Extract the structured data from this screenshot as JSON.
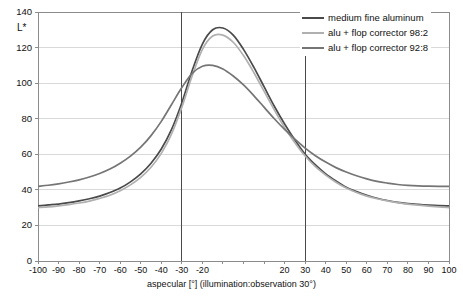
{
  "chart_data": {
    "type": "line",
    "title": "",
    "xlabel": "aspecular [°] (illumination:observation 30°)",
    "ylabel": "L*",
    "xlim": [
      -100,
      100
    ],
    "ylim": [
      0,
      140
    ],
    "y_ticks": [
      0,
      20,
      40,
      60,
      80,
      100,
      120,
      140
    ],
    "y_tick_labels": [
      "0",
      "20",
      "40",
      "60",
      "80",
      "100",
      "120",
      "140"
    ],
    "x_ticks": [
      -100,
      -90,
      -80,
      -70,
      -60,
      -50,
      -40,
      -30,
      -20,
      -10,
      0,
      10,
      20,
      30,
      40,
      50,
      60,
      70,
      80,
      90,
      100
    ],
    "x_tick_labels": [
      "-100",
      "-90",
      "-80",
      "-70",
      "-60",
      "-50",
      "-40",
      "-30",
      "-20",
      "",
      "",
      "",
      "20",
      "30",
      "40",
      "50",
      "60",
      "70",
      "80",
      "90",
      "100"
    ],
    "grid": "horizontal",
    "legend_position": "top-right",
    "markers": {
      "vertical_lines": [
        -30,
        30
      ],
      "vertical_line_color": "#4a4a4a"
    },
    "x": [
      -100,
      -95,
      -90,
      -85,
      -80,
      -75,
      -70,
      -65,
      -60,
      -55,
      -50,
      -45,
      -40,
      -35,
      -30,
      -25,
      -20,
      -15,
      -10,
      -5,
      0,
      5,
      10,
      15,
      20,
      25,
      30,
      35,
      40,
      45,
      50,
      55,
      60,
      65,
      70,
      75,
      80,
      85,
      90,
      95,
      100
    ],
    "series": [
      {
        "name": "medium fine aluminum",
        "color": "#4a4a4a",
        "values": [
          31,
          31.5,
          32,
          32.8,
          33.8,
          35,
          36.5,
          38.5,
          41,
          44.5,
          49,
          55,
          63,
          74,
          89,
          107,
          122,
          130,
          131,
          127,
          119,
          109,
          98,
          87,
          77,
          68,
          60,
          54,
          49,
          45,
          41.5,
          39,
          37,
          35.3,
          34,
          33,
          32.3,
          31.8,
          31.4,
          31.1,
          31
        ]
      },
      {
        "name": "alu + flop corrector 98:2",
        "color": "#b0b0b0",
        "values": [
          30,
          30.4,
          31,
          31.7,
          32.6,
          33.7,
          35.2,
          37,
          39.5,
          42.8,
          47,
          52.7,
          60.5,
          71.5,
          86.5,
          104,
          119,
          126.5,
          127,
          123,
          115.5,
          106,
          95.5,
          85,
          75,
          66.5,
          59,
          53,
          48.3,
          44.3,
          41,
          38.5,
          36.5,
          35,
          33.8,
          32.8,
          32,
          31.4,
          30.9,
          30.4,
          30
        ]
      },
      {
        "name": "alu + flop corrector 92:8",
        "color": "#757575",
        "values": [
          42,
          42.6,
          43.4,
          44.4,
          45.6,
          47.2,
          49.2,
          51.7,
          55,
          59,
          64,
          70.5,
          78.5,
          88,
          97.5,
          105.5,
          109.5,
          110,
          108,
          104,
          99,
          93,
          86.5,
          80,
          74,
          68.5,
          63.5,
          59.2,
          55.6,
          52.5,
          50,
          47.9,
          46.2,
          44.8,
          43.8,
          43,
          42.5,
          42.2,
          42.05,
          42,
          42
        ]
      }
    ]
  },
  "legend": {
    "items": [
      {
        "label": "medium fine aluminum",
        "color": "#4a4a4a"
      },
      {
        "label": "alu + flop corrector 98:2",
        "color": "#b0b0b0"
      },
      {
        "label": "alu + flop corrector 92:8",
        "color": "#757575"
      }
    ]
  },
  "axes": {
    "y_title": "L*",
    "x_title": "aspecular [°] (illumination:observation 30°)"
  },
  "colors": {
    "grid": "#d9d9d9",
    "frame": "#8c8c8c",
    "text": "#111111",
    "background": "#ffffff"
  }
}
